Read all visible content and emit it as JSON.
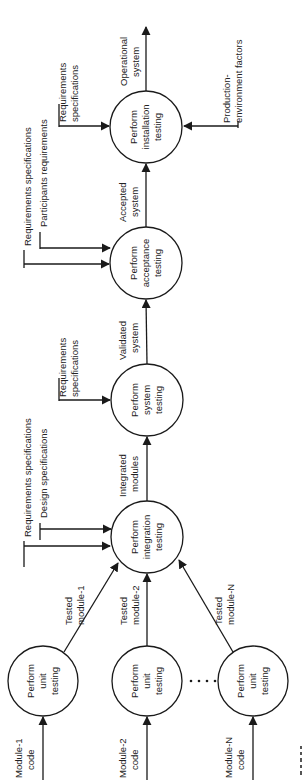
{
  "diagram": {
    "orientation": "rotated-90-ccw",
    "flow_direction": "upward (left-to-right when unrotated)",
    "nodes": [
      {
        "id": "unit1",
        "lines": [
          "Perform",
          "unit",
          "testing"
        ]
      },
      {
        "id": "unit2",
        "lines": [
          "Perform",
          "unit",
          "testing"
        ]
      },
      {
        "id": "unitN",
        "lines": [
          "Perform",
          "unit",
          "testing"
        ]
      },
      {
        "id": "integration",
        "lines": [
          "Perform",
          "integration",
          "testing"
        ]
      },
      {
        "id": "system",
        "lines": [
          "Perform",
          "system",
          "testing"
        ]
      },
      {
        "id": "acceptance",
        "lines": [
          "Perform",
          "acceptance",
          "testing"
        ]
      },
      {
        "id": "installation",
        "lines": [
          "Perform",
          "installation",
          "testing"
        ]
      }
    ],
    "inputs": {
      "module1": [
        "Module-1",
        "code"
      ],
      "module2": [
        "Module-2",
        "code"
      ],
      "moduleN": [
        "Module-N",
        "code"
      ],
      "integration_req": "Requirements specifications",
      "integration_design": "Design specifications",
      "system_req": [
        "Requirements",
        "specifications"
      ],
      "acceptance_req": "Requirements specifications",
      "acceptance_part": "Participants requirements",
      "installation_req": [
        "Requirements",
        "specifications"
      ],
      "installation_env": [
        "Production-",
        "environment factors"
      ]
    },
    "edges": {
      "tested1": [
        "Tested",
        "module-1"
      ],
      "tested2": [
        "Tested",
        "module-2"
      ],
      "testedN": [
        "Tested",
        "module-N"
      ],
      "integrated": [
        "Integrated",
        "modules"
      ],
      "validated": [
        "Validated",
        "system"
      ],
      "accepted": [
        "Accepted",
        "system"
      ],
      "operational": [
        "Operational",
        "system"
      ]
    },
    "ellipsis": "• • • •"
  }
}
